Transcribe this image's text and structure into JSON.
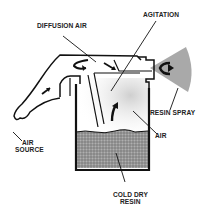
{
  "diagram": {
    "type": "process schematic",
    "labels": {
      "diffusion_air": "DIFFUSION AIR",
      "agitation": "AGITATION",
      "resin_spray": "RESIN SPRAY",
      "air": "AIR",
      "air_source_line1": "AIR",
      "air_source_line2": "SOURCE",
      "cold_dry_resin_line1": "COLD DRY",
      "cold_dry_resin_line2": "RESIN"
    },
    "colors": {
      "ink": "#111111",
      "resin_fill": "#8c8c8c",
      "spray_fill": "#9a9a9a",
      "air_haze": "#e6e6e6",
      "background": "#ffffff"
    }
  }
}
